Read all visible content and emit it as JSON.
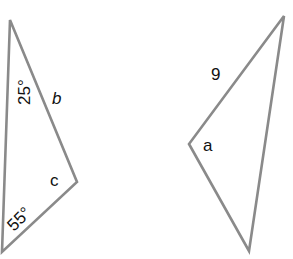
{
  "diagram": {
    "stroke_color": "#8a8a8a",
    "triangles": [
      {
        "name": "left-triangle",
        "points": "10,20 77,182 2,252",
        "labels": [
          {
            "text": "25°",
            "x": 29,
            "y": 88,
            "rotate": -90
          },
          {
            "text": "b",
            "x": 54,
            "y": 104,
            "italic": true
          },
          {
            "text": "c",
            "x": 50,
            "y": 186
          },
          {
            "text": "55°",
            "x": 18,
            "y": 226,
            "rotate": -45
          }
        ]
      },
      {
        "name": "right-triangle",
        "points": "284,16 189,144 249,251",
        "labels": [
          {
            "text": "9",
            "x": 212,
            "y": 80
          },
          {
            "text": "a",
            "x": 203,
            "y": 151
          }
        ]
      }
    ]
  }
}
